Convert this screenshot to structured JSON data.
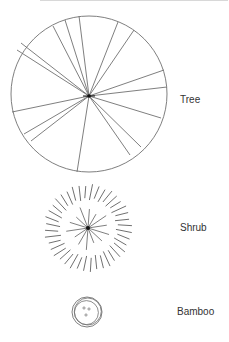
{
  "legend": {
    "items": [
      {
        "key": "tree",
        "label": "Tree",
        "label_x": 180,
        "label_y": 94
      },
      {
        "key": "shrub",
        "label": "Shrub",
        "label_x": 180,
        "label_y": 222
      },
      {
        "key": "bamboo",
        "label": "Bamboo",
        "label_x": 177,
        "label_y": 306
      }
    ]
  },
  "colors": {
    "stroke": "#707070",
    "hub": "#111111",
    "text": "#333333",
    "background": "#ffffff"
  },
  "symbols": {
    "tree": {
      "cx": 89,
      "cy": 94,
      "r": 78,
      "hub": [
        89,
        96
      ],
      "spokes": [
        [
          53,
          26
        ],
        [
          65,
          20
        ],
        [
          79,
          16
        ],
        [
          118,
          22
        ],
        [
          134,
          30
        ],
        [
          17,
          50
        ],
        [
          21,
          43
        ],
        [
          164,
          70
        ],
        [
          167,
          87
        ],
        [
          161,
          118
        ],
        [
          141,
          147
        ],
        [
          130,
          155
        ],
        [
          77,
          172
        ],
        [
          31,
          141
        ],
        [
          24,
          134
        ],
        [
          12,
          112
        ]
      ]
    },
    "shrub": {
      "cx": 88,
      "cy": 228,
      "inner_r": 22,
      "outer_r1": 28,
      "outer_r2": 44,
      "outer_ticks": 40,
      "inner_spokes": 14
    },
    "bamboo": {
      "cx": 87,
      "cy": 312,
      "r": 15,
      "dots": [
        [
          84,
          308
        ],
        [
          89,
          309
        ],
        [
          86,
          315
        ]
      ]
    }
  }
}
